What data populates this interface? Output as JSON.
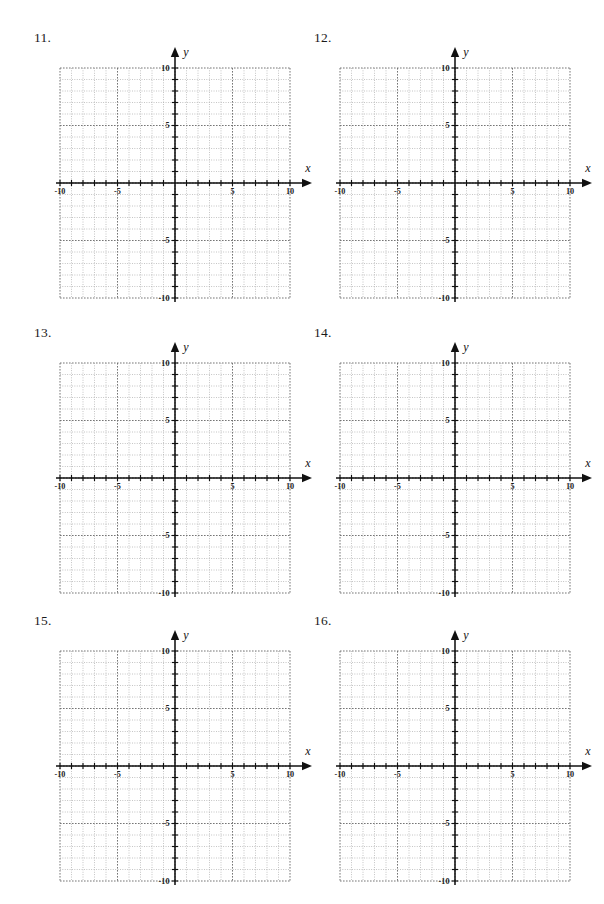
{
  "page": {
    "width": 604,
    "height": 904,
    "background": "#ffffff",
    "ink_color": "#1b1b1b",
    "grid_color": "#8c8c8c",
    "axis_color": "#111111"
  },
  "worksheet": {
    "kind": "blank-coordinate-grid-worksheet",
    "problem_count": 6,
    "columns": 2,
    "rows": 3
  },
  "problems": [
    {
      "number": "11.",
      "name": "problem-11",
      "col": 0,
      "row": 0
    },
    {
      "number": "12.",
      "name": "problem-12",
      "col": 1,
      "row": 0
    },
    {
      "number": "13.",
      "name": "problem-13",
      "col": 0,
      "row": 1
    },
    {
      "number": "14.",
      "name": "problem-14",
      "col": 1,
      "row": 1
    },
    {
      "number": "15.",
      "name": "problem-15",
      "col": 0,
      "row": 2
    },
    {
      "number": "16.",
      "name": "problem-16",
      "col": 1,
      "row": 2
    }
  ],
  "chart_data": {
    "type": "scatter",
    "title": "",
    "subtitle": "",
    "xlabel": "x",
    "ylabel": "y",
    "xlim": [
      -10,
      10
    ],
    "ylim": [
      -10,
      10
    ],
    "x_major_step": 5,
    "y_major_step": 5,
    "x_minor_step": 1,
    "y_minor_step": 1,
    "grid": true,
    "grid_style": "dotted",
    "legend": false,
    "legend_position": "none",
    "x_tick_labels": [
      "-10",
      "-5",
      "5",
      "10"
    ],
    "y_tick_labels": [
      "10",
      "5",
      "-5",
      "-10"
    ],
    "x_tick_values": [
      -10,
      -5,
      5,
      10
    ],
    "y_tick_values": [
      10,
      5,
      -5,
      -10
    ],
    "series": [],
    "values": [],
    "annotations": [],
    "note": "Six identical empty Cartesian coordinate planes; no data plotted."
  },
  "axes": {
    "x_axis_name": "x-axis",
    "y_axis_name": "y-axis",
    "x_arrow": "right",
    "y_arrow": "up",
    "x_label_text": "x",
    "y_label_text": "y"
  }
}
